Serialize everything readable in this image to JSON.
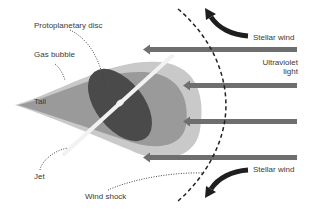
{
  "diagram": {
    "labels": {
      "protoplanetary_disc": "Protoplanetary disc",
      "gas_bubble": "Gas bubble",
      "tail": "Tail",
      "jet": "Jet",
      "wind_shock": "Wind shock",
      "stellar_wind_top": "Stellar wind",
      "ultraviolet_line1": "Ultraviolet",
      "ultraviolet_line2": "light",
      "stellar_wind_bottom": "Stellar wind"
    },
    "colors": {
      "outer_bubble": "#c9c9c9",
      "inner_bubble": "#9a9a9a",
      "disc": "#4a4a4a",
      "jet": "#f2f2f2",
      "uv_arrows": "#6e6e6e",
      "wind_arrows": "#1e1e1e",
      "shock_line": "#222222",
      "leader_lines": "#444444"
    }
  }
}
